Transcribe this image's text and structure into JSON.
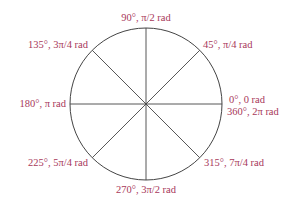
{
  "diagram": {
    "type": "unit-circle-angles",
    "colors": {
      "label": "#a8385a",
      "line": "#444444",
      "background": "#ffffff"
    },
    "center": [
      146,
      104
    ],
    "radius": 76,
    "angles": [
      {
        "deg": 0,
        "label": "0°, 0 rad",
        "label2": "360°, 2π rad"
      },
      {
        "deg": 45,
        "label": "45°, π/4 rad"
      },
      {
        "deg": 90,
        "label": "90°, π/2 rad"
      },
      {
        "deg": 135,
        "label": "135°, 3π/4 rad"
      },
      {
        "deg": 180,
        "label": "180°, π rad"
      },
      {
        "deg": 225,
        "label": "225°, 5π/4 rad"
      },
      {
        "deg": 270,
        "label": "270°, 3π/2 rad"
      },
      {
        "deg": 315,
        "label": "315°, 7π/4 rad"
      }
    ]
  }
}
